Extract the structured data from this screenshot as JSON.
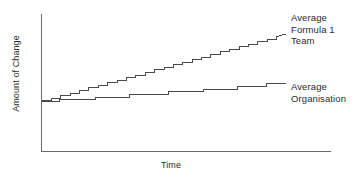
{
  "chart_data": {
    "type": "line",
    "title": "",
    "xlabel": "Time",
    "ylabel": "Amount of Change",
    "xlim": [
      0,
      100
    ],
    "ylim": [
      0,
      100
    ],
    "grid": false,
    "legend_position": "right-inline",
    "axis_color": "#555555",
    "line_color": "#4a4a4a",
    "note": "Two monotonically increasing staircase step curves sharing a common origin; the Formula 1 team curve rises with many small frequent steps at a steep slope, the average organisation curve rises with fewer, wider steps at a shallow slope.",
    "series": [
      {
        "name": "Average Formula 1 Team",
        "label_lines": "Average\nFormula 1\nTeam",
        "step_count": 26,
        "start": [
          0,
          11
        ],
        "end": [
          100,
          76
        ],
        "x": [
          0,
          3.8,
          3.8,
          7.7,
          7.7,
          11.5,
          11.5,
          15.4,
          15.4,
          19.2,
          19.2,
          23.1,
          23.1,
          26.9,
          26.9,
          30.8,
          30.8,
          34.6,
          34.6,
          38.5,
          38.5,
          42.3,
          42.3,
          46.2,
          46.2,
          50.0,
          50.0,
          53.8,
          53.8,
          57.7,
          57.7,
          61.5,
          61.5,
          65.4,
          65.4,
          69.2,
          69.2,
          73.1,
          73.1,
          76.9,
          76.9,
          80.8,
          80.8,
          84.6,
          84.6,
          88.5,
          88.5,
          92.3,
          92.3,
          96.2,
          96.2,
          100
        ],
        "y": [
          11,
          11,
          13.5,
          13.5,
          16,
          16,
          18.5,
          18.5,
          21,
          21,
          23.5,
          23.5,
          26,
          26,
          28.5,
          28.5,
          31,
          31,
          33.5,
          33.5,
          36,
          36,
          38.5,
          38.5,
          41,
          41,
          43.5,
          43.5,
          46,
          46,
          48.5,
          48.5,
          51,
          51,
          53.5,
          53.5,
          56,
          56,
          58.5,
          58.5,
          61,
          61,
          63.5,
          63.5,
          66,
          66,
          68.5,
          68.5,
          71,
          71,
          73.5,
          76
        ]
      },
      {
        "name": "Average Organisation",
        "label_lines": "Average\nOrganisation",
        "step_count": 7,
        "start": [
          0,
          10
        ],
        "end": [
          100,
          28
        ],
        "x": [
          0,
          7,
          7,
          22,
          22,
          36,
          36,
          52,
          52,
          66,
          66,
          80,
          80,
          92,
          92,
          100
        ],
        "y": [
          10,
          10,
          12.5,
          12.5,
          14.5,
          14.5,
          17,
          17,
          19.5,
          19.5,
          22,
          22,
          25,
          25,
          27.5,
          28
        ]
      }
    ]
  },
  "axes": {
    "x_axis_name": "time-axis",
    "y_axis_name": "amount-of-change-axis"
  }
}
